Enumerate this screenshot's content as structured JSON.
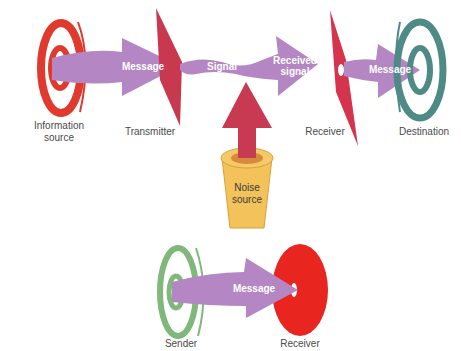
{
  "colors": {
    "arrow": "#b486c4",
    "source_spiral": "#e03a2f",
    "transmitter": "#c8384e",
    "receiver_shape": "#d6344c",
    "destination_spiral": "#4e8a86",
    "noise_arrow": "#c73a52",
    "noise_cup": "#f3c25a",
    "sender_spiral": "#7fb87a",
    "receiver_disc": "#e8261f",
    "label_text": "#4a4a4a"
  },
  "top_diagram": {
    "nodes": {
      "information_source": "Information\nsource",
      "transmitter": "Transmitter",
      "receiver": "Receiver",
      "destination": "Destination",
      "noise_source": "Noise\nsource"
    },
    "arrows": {
      "message_1": "Message",
      "signal": "Signal",
      "received_signal": "Received\nsignal",
      "message_2": "Message"
    }
  },
  "bottom_diagram": {
    "nodes": {
      "sender": "Sender",
      "receiver": "Receiver"
    },
    "arrows": {
      "message": "Message"
    }
  }
}
